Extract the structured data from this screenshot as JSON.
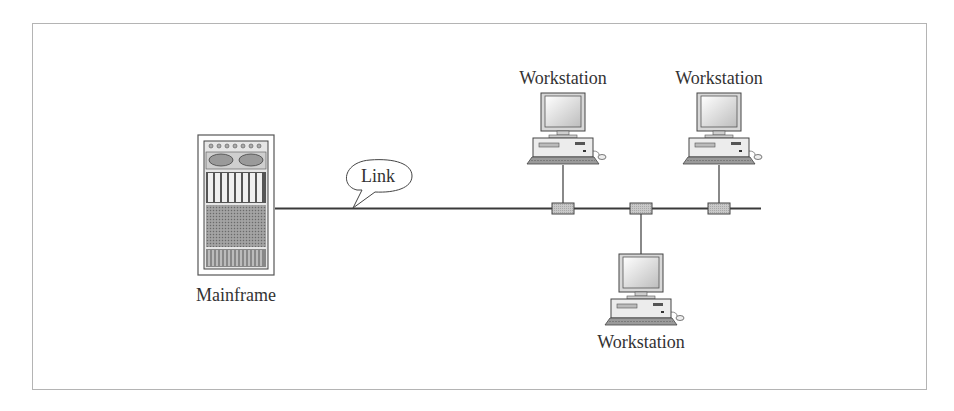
{
  "diagram": {
    "type": "network-topology",
    "colors": {
      "frame": "#b4b4b4",
      "line": "#3a3a3a",
      "tap_fill": "#c4c4c4",
      "text": "#333333"
    },
    "nodes": [
      {
        "id": "mainframe",
        "label": "Mainframe"
      },
      {
        "id": "ws1",
        "label": "Workstation"
      },
      {
        "id": "ws2",
        "label": "Workstation"
      },
      {
        "id": "ws3",
        "label": "Workstation"
      }
    ],
    "link_callout": "Link",
    "edges": [
      {
        "from": "mainframe",
        "to": "bus"
      },
      {
        "from": "ws1",
        "to": "bus"
      },
      {
        "from": "ws3",
        "to": "bus"
      },
      {
        "from": "ws2",
        "to": "bus"
      }
    ]
  }
}
